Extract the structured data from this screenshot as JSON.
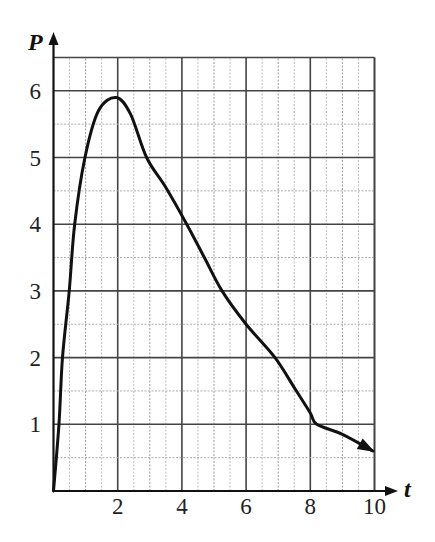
{
  "chart_data": {
    "type": "line",
    "title": "",
    "xlabel": "t",
    "ylabel": "P",
    "xlim": [
      0,
      10
    ],
    "ylim": [
      0,
      6.5
    ],
    "x_ticks": [
      2,
      4,
      6,
      8,
      10
    ],
    "x_tick_labels": [
      "2",
      "4",
      "6",
      "8",
      "10"
    ],
    "y_ticks": [
      1,
      2,
      3,
      4,
      5,
      6
    ],
    "y_tick_labels": [
      "1",
      "2",
      "3",
      "4",
      "5",
      "6"
    ],
    "grid": {
      "on": true,
      "major_step_x": 2,
      "minor_step_x": 0.5,
      "major_step_y": 1,
      "minor_step_y": 0.5
    },
    "legend": null,
    "series": [
      {
        "name": "P(t)",
        "end_arrow": true,
        "x": [
          0,
          0.17,
          0.28,
          0.49,
          0.66,
          0.98,
          1.4,
          1.95,
          2.4,
          2.9,
          3.5,
          4.15,
          4.7,
          5.25,
          6.0,
          6.9,
          7.5,
          8.0,
          8.2,
          9.0,
          9.95
        ],
        "y": [
          0,
          1,
          2,
          3,
          4,
          5,
          5.7,
          5.9,
          5.65,
          5.0,
          4.55,
          4.0,
          3.5,
          3.0,
          2.5,
          2.0,
          1.55,
          1.17,
          1.0,
          0.85,
          0.6
        ]
      }
    ]
  }
}
